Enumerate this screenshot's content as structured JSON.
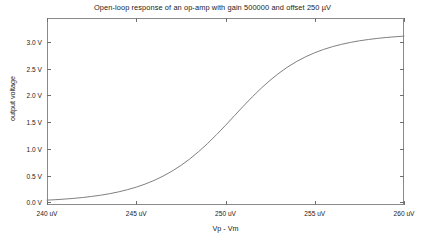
{
  "chart_data": {
    "type": "line",
    "title": "Open-loop response of an op-amp with gain 500000 and offset 250 µV",
    "xlabel": "Vp - Vm",
    "ylabel": "output voltage",
    "xlim": [
      240,
      260
    ],
    "ylim": [
      -0.05,
      3.45
    ],
    "xunit": "uV",
    "yunit": "V",
    "grid": false,
    "legend": null,
    "xticks": [
      240,
      245,
      250,
      255,
      260
    ],
    "xtick_labels": [
      "240 uV",
      "245 uV",
      "250 uV",
      "255 uV",
      "260 uV"
    ],
    "yticks": [
      0.0,
      0.5,
      1.0,
      1.5,
      2.0,
      2.5,
      3.0
    ],
    "ytick_labels": [
      "0.0 V",
      "0.5 V",
      "1.0 V",
      "1.5 V",
      "2.0 V",
      "2.5 V",
      "3.0 V"
    ],
    "series": [
      {
        "name": "open-loop output",
        "color": "#808080",
        "x": [
          240.0,
          240.5,
          241.0,
          241.5,
          242.0,
          242.5,
          243.0,
          243.5,
          244.0,
          244.5,
          245.0,
          245.5,
          246.0,
          246.5,
          247.0,
          247.5,
          248.0,
          248.5,
          249.0,
          249.5,
          250.0,
          250.5,
          251.0,
          251.5,
          252.0,
          252.5,
          253.0,
          253.5,
          254.0,
          254.5,
          255.0,
          255.5,
          256.0,
          256.5,
          257.0,
          257.5,
          258.0,
          258.5,
          259.0,
          259.5,
          260.0
        ],
        "y": [
          0.041,
          0.05,
          0.061,
          0.074,
          0.09,
          0.11,
          0.133,
          0.161,
          0.195,
          0.236,
          0.284,
          0.342,
          0.41,
          0.49,
          0.583,
          0.69,
          0.812,
          0.95,
          1.102,
          1.267,
          1.441,
          1.621,
          1.8,
          1.973,
          2.136,
          2.285,
          2.419,
          2.537,
          2.639,
          2.726,
          2.8,
          2.862,
          2.914,
          2.957,
          2.993,
          3.023,
          3.047,
          3.068,
          3.085,
          3.099,
          3.111
        ]
      }
    ],
    "annotations": {
      "gain": "500000",
      "offset": "250 µV",
      "saturation_high": "3.3 V",
      "saturation_low": "0.0 V"
    },
    "colors": {
      "background": "#ffffff",
      "axis": "#8a8a8a",
      "tick": "#6f6f6f",
      "text": "#1b1b1b",
      "curve": "#808080"
    }
  }
}
